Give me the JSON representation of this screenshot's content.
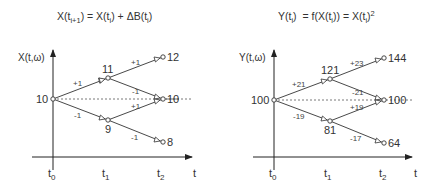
{
  "left_panel": {
    "equation": {
      "lhs": "X(t",
      "lhs_sub": "i+1",
      "mid": ") = X(t",
      "mid_sub": "i",
      "rest": ") + ΔB(t",
      "rest_sub": "i",
      "end": ")"
    },
    "y_axis_label": "X(t,ω)",
    "x_axis_label": "t",
    "ticks": [
      {
        "base": "t",
        "sub": "0"
      },
      {
        "base": "t",
        "sub": "1"
      },
      {
        "base": "t",
        "sub": "2"
      }
    ],
    "nodes": {
      "root": "10",
      "t1_up": "11",
      "t1_down": "9",
      "t2_up": "12",
      "t2_mid": "10",
      "t2_down": "8"
    },
    "edges": {
      "root_up": "+1",
      "root_down": "-1",
      "up_up": "+1",
      "up_down": "-1",
      "down_up": "+1",
      "down_down": "-1"
    }
  },
  "right_panel": {
    "equation": {
      "lhs": "Y(t",
      "lhs_sub": "i",
      "mid": ")  = f(X(t",
      "mid_sub": "i",
      "rest": ")) = X(t",
      "rest_sub": "i",
      "end": ")",
      "sup": "2"
    },
    "y_axis_label": "Y(t,ω)",
    "x_axis_label": "t",
    "ticks": [
      {
        "base": "t",
        "sub": "0"
      },
      {
        "base": "t",
        "sub": "1"
      },
      {
        "base": "t",
        "sub": "2"
      }
    ],
    "nodes": {
      "root": "100",
      "t1_up": "121",
      "t1_down": "81",
      "t2_up": "144",
      "t2_mid": "100",
      "t2_down": "64"
    },
    "edges": {
      "root_up": "+21",
      "root_down": "-19",
      "up_up": "+23",
      "up_down": "-21",
      "down_up": "+19",
      "down_down": "-17"
    }
  },
  "colors": {
    "line": "#333333",
    "text": "#333333",
    "dotted": "#555555",
    "background": "#ffffff"
  }
}
